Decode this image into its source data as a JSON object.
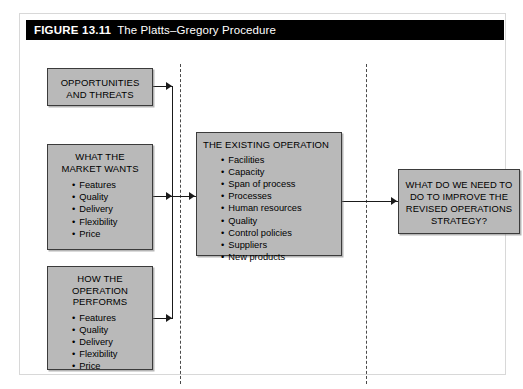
{
  "figure": {
    "label": "FIGURE 13.11",
    "title": "The Platts–Gregory Procedure"
  },
  "boxes": {
    "opportunities": {
      "heading": "OPPORTUNITIES\nAND THREATS",
      "items": []
    },
    "market_wants": {
      "heading": "WHAT THE\nMARKET WANTS",
      "items": [
        "Features",
        "Quality",
        "Delivery",
        "Flexibility",
        "Price"
      ]
    },
    "operation_performs": {
      "heading": "HOW THE\nOPERATION\nPERFORMS",
      "items": [
        "Features",
        "Quality",
        "Delivery",
        "Flexibility",
        "Price"
      ]
    },
    "existing_operation": {
      "heading": "THE EXISTING OPERATION",
      "items": [
        "Facilities",
        "Capacity",
        "Span of process",
        "Processes",
        "Human resources",
        "Quality",
        "Control policies",
        "Suppliers",
        "New products"
      ]
    },
    "question": {
      "heading": "WHAT DO WE NEED TO\nDO TO IMPROVE THE\nREVISED OPERATIONS\nSTRATEGY?",
      "items": []
    }
  },
  "colors": {
    "box_fill": "#b9b9b9",
    "box_border": "#3b3b3b",
    "title_bar_bg": "#000000",
    "title_bar_text": "#ffffff",
    "line": "#1a1a1a",
    "dashed_divider": "#4a4a4a"
  }
}
